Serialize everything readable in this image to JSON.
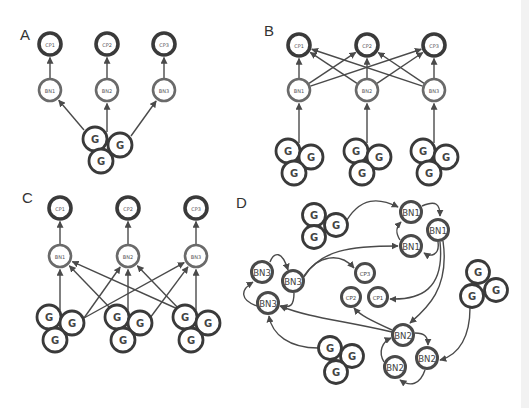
{
  "figure": {
    "panels": [
      {
        "id": "A",
        "label": "A",
        "nodes": [
          {
            "id": "cp1",
            "type": "cp",
            "label": "CP1"
          },
          {
            "id": "cp2",
            "type": "cp",
            "label": "CP2"
          },
          {
            "id": "cp3",
            "type": "cp",
            "label": "CP3"
          },
          {
            "id": "bn1",
            "type": "bn",
            "label": "BN1"
          },
          {
            "id": "bn2",
            "type": "bn",
            "label": "BN2"
          },
          {
            "id": "bn3",
            "type": "bn",
            "label": "BN3"
          },
          {
            "id": "g1",
            "type": "g",
            "label": "G"
          },
          {
            "id": "g2",
            "type": "g",
            "label": "G"
          },
          {
            "id": "g3",
            "type": "g",
            "label": "G"
          }
        ],
        "edges": [
          [
            "bn1",
            "cp1"
          ],
          [
            "bn2",
            "cp2"
          ],
          [
            "bn3",
            "cp3"
          ],
          [
            "g-cluster",
            "bn1"
          ],
          [
            "g-cluster",
            "bn2"
          ],
          [
            "g-cluster",
            "bn3"
          ]
        ]
      },
      {
        "id": "B",
        "label": "B",
        "nodes": [
          {
            "id": "cp1",
            "type": "cp",
            "label": "CP1"
          },
          {
            "id": "cp2",
            "type": "cp",
            "label": "CP2"
          },
          {
            "id": "cp3",
            "type": "cp",
            "label": "CP3"
          },
          {
            "id": "bn1",
            "type": "bn",
            "label": "BN1"
          },
          {
            "id": "bn2",
            "type": "bn",
            "label": "BN2"
          },
          {
            "id": "bn3",
            "type": "bn",
            "label": "BN3"
          },
          {
            "id": "g",
            "type": "g",
            "label": "G"
          }
        ],
        "edges": [
          [
            "bn1",
            "cp1"
          ],
          [
            "bn1",
            "cp2"
          ],
          [
            "bn1",
            "cp3"
          ],
          [
            "bn2",
            "cp1"
          ],
          [
            "bn2",
            "cp2"
          ],
          [
            "bn2",
            "cp3"
          ],
          [
            "bn3",
            "cp1"
          ],
          [
            "bn3",
            "cp2"
          ],
          [
            "bn3",
            "cp3"
          ],
          [
            "g-cluster-1",
            "bn1"
          ],
          [
            "g-cluster-2",
            "bn2"
          ],
          [
            "g-cluster-3",
            "bn3"
          ]
        ]
      },
      {
        "id": "C",
        "label": "C",
        "nodes": [
          {
            "id": "cp1",
            "type": "cp",
            "label": "CP1"
          },
          {
            "id": "cp2",
            "type": "cp",
            "label": "CP2"
          },
          {
            "id": "cp3",
            "type": "cp",
            "label": "CP3"
          },
          {
            "id": "bn1",
            "type": "bn",
            "label": "BN1"
          },
          {
            "id": "bn2",
            "type": "bn",
            "label": "BN2"
          },
          {
            "id": "bn3",
            "type": "bn",
            "label": "BN3"
          },
          {
            "id": "g",
            "type": "g",
            "label": "G"
          }
        ],
        "edges": [
          [
            "bn1",
            "cp1"
          ],
          [
            "bn2",
            "cp2"
          ],
          [
            "bn3",
            "cp3"
          ],
          [
            "g-cluster-1",
            "bn1"
          ],
          [
            "g-cluster-1",
            "bn2"
          ],
          [
            "g-cluster-1",
            "bn3"
          ],
          [
            "g-cluster-2",
            "bn1"
          ],
          [
            "g-cluster-2",
            "bn2"
          ],
          [
            "g-cluster-2",
            "bn3"
          ],
          [
            "g-cluster-3",
            "bn1"
          ],
          [
            "g-cluster-3",
            "bn2"
          ],
          [
            "g-cluster-3",
            "bn3"
          ]
        ]
      },
      {
        "id": "D",
        "label": "D",
        "nodes": [
          {
            "id": "bn1a",
            "type": "bn",
            "label": "BN1"
          },
          {
            "id": "bn1b",
            "type": "bn",
            "label": "BN1"
          },
          {
            "id": "bn1c",
            "type": "bn",
            "label": "BN1"
          },
          {
            "id": "bn2a",
            "type": "bn",
            "label": "BN2"
          },
          {
            "id": "bn2b",
            "type": "bn",
            "label": "BN2"
          },
          {
            "id": "bn2c",
            "type": "bn",
            "label": "BN2"
          },
          {
            "id": "bn3a",
            "type": "bn",
            "label": "BN3"
          },
          {
            "id": "bn3b",
            "type": "bn",
            "label": "BN3"
          },
          {
            "id": "bn3c",
            "type": "bn",
            "label": "BN3"
          },
          {
            "id": "cp1",
            "type": "cp",
            "label": "CP1"
          },
          {
            "id": "cp2",
            "type": "cp",
            "label": "CP2"
          },
          {
            "id": "cp3",
            "type": "cp",
            "label": "CP3"
          },
          {
            "id": "g",
            "type": "g",
            "label": "G"
          }
        ]
      }
    ]
  },
  "labels": {
    "A": "A",
    "B": "B",
    "C": "C",
    "D": "D",
    "CP1": "CP1",
    "CP2": "CP2",
    "CP3": "CP3",
    "BN1": "BN1",
    "BN2": "BN2",
    "BN3": "BN3",
    "G": "G"
  }
}
